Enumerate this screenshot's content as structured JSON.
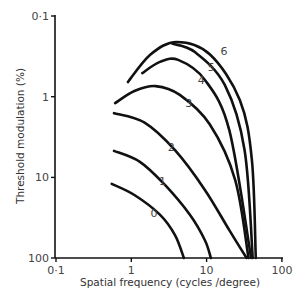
{
  "chart_data": {
    "type": "line",
    "title": "",
    "xlabel": "Spatial frequency (cycles /degree)",
    "ylabel": "Threshold modulation (%)",
    "xscale": "log",
    "yscale": "log",
    "yinverted": true,
    "xlim": [
      0.1,
      100
    ],
    "ylim": [
      0.1,
      100
    ],
    "xticks": [
      {
        "value": 0.1,
        "label": "0·1"
      },
      {
        "value": 1,
        "label": "1"
      },
      {
        "value": 10,
        "label": "10"
      },
      {
        "value": 100,
        "label": "100"
      }
    ],
    "yticks": [
      {
        "value": 0.1,
        "label": "0·1"
      },
      {
        "value": 1,
        "label": "1"
      },
      {
        "value": 10,
        "label": "10"
      },
      {
        "value": 100,
        "label": "100"
      }
    ],
    "grid": false,
    "legend": "none (curves labelled inline)",
    "series": [
      {
        "name": "0",
        "label_at": [
          2.0,
          28
        ],
        "points": [
          [
            0.55,
            12
          ],
          [
            1.1,
            16.5
          ],
          [
            2.4,
            29
          ],
          [
            3.8,
            52
          ],
          [
            5.0,
            100
          ]
        ]
      },
      {
        "name": "1",
        "label_at": [
          2.6,
          11
        ],
        "points": [
          [
            0.59,
            4.7
          ],
          [
            1.3,
            6.4
          ],
          [
            2.8,
            12.4
          ],
          [
            6.0,
            29
          ],
          [
            9.5,
            60
          ],
          [
            11.4,
            100
          ]
        ]
      },
      {
        "name": "2",
        "label_at": [
          3.4,
          4.2
        ],
        "points": [
          [
            0.59,
            1.6
          ],
          [
            1.5,
            2.1
          ],
          [
            3.8,
            4.6
          ],
          [
            9.5,
            14.3
          ],
          [
            20,
            45
          ],
          [
            34,
            100
          ]
        ]
      },
      {
        "name": "3",
        "label_at": [
          5.8,
          1.2
        ],
        "points": [
          [
            0.61,
            1.2
          ],
          [
            1.1,
            0.85
          ],
          [
            2.1,
            0.74
          ],
          [
            4.4,
            0.95
          ],
          [
            11,
            2.2
          ],
          [
            24,
            10.8
          ],
          [
            36,
            100
          ]
        ]
      },
      {
        "name": "4",
        "label_at": [
          8.5,
          0.62
        ],
        "points": [
          [
            1.4,
            0.51
          ],
          [
            2.4,
            0.37
          ],
          [
            4.2,
            0.35
          ],
          [
            9.5,
            0.62
          ],
          [
            20,
            2.6
          ],
          [
            39,
            100
          ]
        ]
      },
      {
        "name": "5",
        "label_at": [
          11.5,
          0.43
        ],
        "points": [
          [
            3.5,
            0.22
          ],
          [
            7.0,
            0.28
          ],
          [
            17.5,
            0.72
          ],
          [
            32,
            4.6
          ],
          [
            41,
            100
          ]
        ]
      },
      {
        "name": "6",
        "label_at": [
          17,
          0.27
        ],
        "points": [
          [
            0.9,
            0.66
          ],
          [
            1.8,
            0.3
          ],
          [
            4.0,
            0.21
          ],
          [
            11.1,
            0.3
          ],
          [
            27.6,
            1.1
          ],
          [
            40,
            6.1
          ],
          [
            45,
            100
          ]
        ]
      }
    ]
  }
}
